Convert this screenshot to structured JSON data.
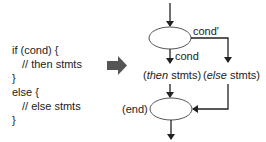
{
  "code": {
    "lines": [
      {
        "text": "if (cond) {",
        "indent": 0
      },
      {
        "text": "// then stmts",
        "indent": 1
      },
      {
        "text": "}",
        "indent": 0
      },
      {
        "text": "else {",
        "indent": 0
      },
      {
        "text": "// else stmts",
        "indent": 1
      },
      {
        "text": "}",
        "indent": 0
      }
    ]
  },
  "transform_arrow": {
    "icon": "right-arrow-icon",
    "color": "#555555"
  },
  "flowchart": {
    "cond_true_label": "cond",
    "cond_false_label": "cond'",
    "then_block": {
      "open": "(",
      "keyword": "then",
      "rest": " stmts)"
    },
    "else_block": {
      "open": "(",
      "keyword": "else",
      "rest": " stmts)"
    },
    "end_label": "(end)",
    "line_color": "#222222",
    "node_stroke": "#555555"
  }
}
